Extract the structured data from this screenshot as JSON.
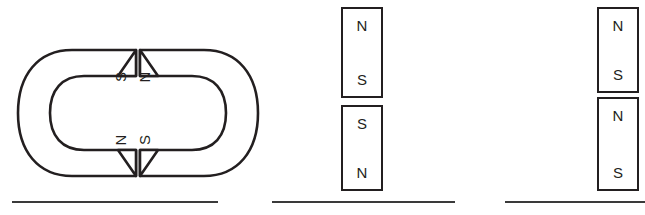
{
  "diagram": {
    "background_color": "#ffffff",
    "stroke_color": "#231f20",
    "line_color": "#3a3a3a"
  },
  "panels": [
    {
      "id": "horseshoe-pair",
      "type": "horseshoe-magnets",
      "description": "Two horseshoe magnets facing each other pole to pole",
      "magnets": [
        {
          "id": "horseshoe-left",
          "orientation": "opens-right",
          "poles": [
            {
              "position": "upper",
              "label": "S"
            },
            {
              "position": "lower",
              "label": "N"
            }
          ]
        },
        {
          "id": "horseshoe-right",
          "orientation": "opens-left",
          "poles": [
            {
              "position": "upper",
              "label": "N"
            },
            {
              "position": "lower",
              "label": "S"
            }
          ]
        }
      ],
      "answer_line": true
    },
    {
      "id": "bar-pair-repel",
      "type": "bar-magnets",
      "description": "Two vertical bar magnets stacked with a gap, like poles facing",
      "magnets": [
        {
          "id": "bar-top-middle",
          "position": "top",
          "top_pole": "N",
          "bottom_pole": "S"
        },
        {
          "id": "bar-bottom-middle",
          "position": "bottom",
          "top_pole": "S",
          "bottom_pole": "N"
        }
      ],
      "answer_line": true
    },
    {
      "id": "bar-pair-attract",
      "type": "bar-magnets",
      "description": "Two vertical bar magnets stacked close together, unlike poles facing",
      "magnets": [
        {
          "id": "bar-top-right",
          "position": "top",
          "top_pole": "N",
          "bottom_pole": "S"
        },
        {
          "id": "bar-bottom-right",
          "position": "bottom",
          "top_pole": "N",
          "bottom_pole": "S"
        }
      ],
      "answer_line": true
    }
  ]
}
